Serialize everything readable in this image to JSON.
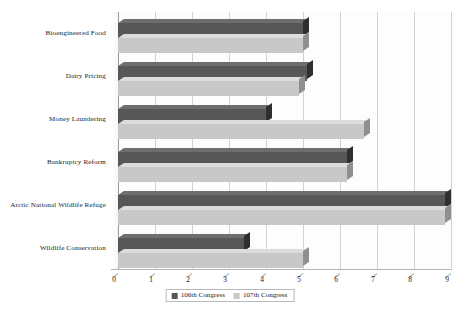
{
  "chart_data": {
    "type": "bar",
    "orientation": "horizontal",
    "title": "",
    "xlabel": "",
    "ylabel": "",
    "xlim": [
      0,
      9
    ],
    "grid": true,
    "legend_position": "bottom-center",
    "tick_labels": [
      "0",
      "1",
      "2",
      "3",
      "4",
      "5",
      "6",
      "7",
      "8",
      "9"
    ],
    "categories": [
      "Bioengineered Food",
      "Dairy Pricing",
      "Money Laundering",
      "Bankruptcy Reform",
      "Arctic National Wildlife Refuge",
      "Wildlife Conservation"
    ],
    "series": [
      {
        "name": "106th Congress",
        "color": "#575757",
        "values": [
          5.0,
          5.1,
          4.0,
          6.2,
          8.85,
          3.4
        ]
      },
      {
        "name": "107th Congress",
        "color": "#c8c8c8",
        "values": [
          5.0,
          4.9,
          6.65,
          6.2,
          8.85,
          5.0
        ]
      }
    ]
  },
  "legend": {
    "items": [
      {
        "label": "106th Congress",
        "color": "#575757"
      },
      {
        "label": "107th Congress",
        "color": "#c8c8c8"
      }
    ]
  }
}
